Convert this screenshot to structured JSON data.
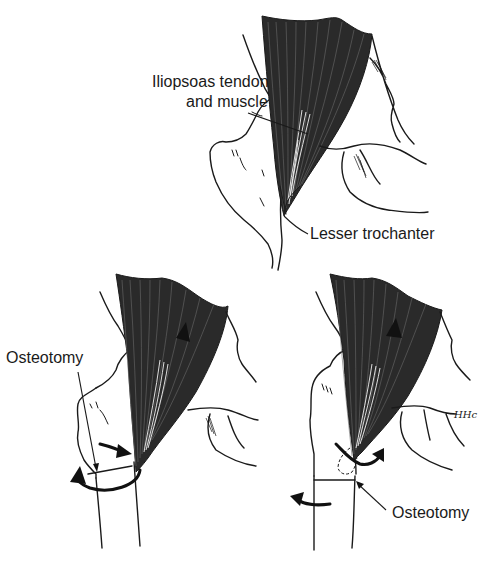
{
  "figure": {
    "panels": [
      {
        "id": "top",
        "labels": {
          "muscle_line1": "Iliopsoas tendon",
          "muscle_line2": "and muscle",
          "trochanter": "Lesser trochanter"
        }
      },
      {
        "id": "bottom-left",
        "labels": {
          "osteotomy": "Osteotomy"
        }
      },
      {
        "id": "bottom-right",
        "labels": {
          "osteotomy": "Osteotomy"
        },
        "signature": "HHc"
      }
    ]
  }
}
